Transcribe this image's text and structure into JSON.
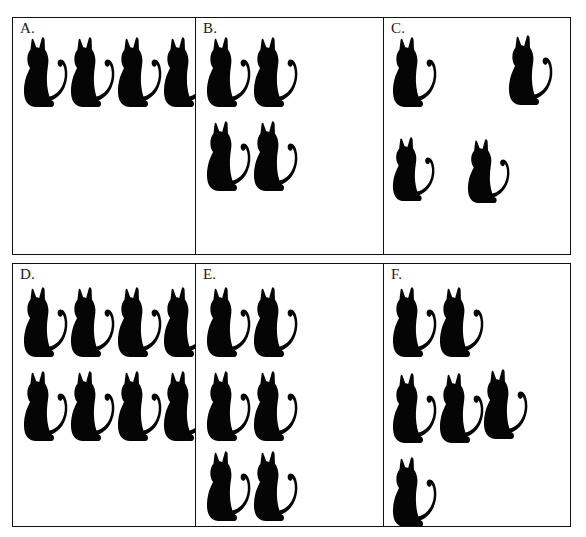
{
  "document": {
    "title": "Counting sets of cats worksheet",
    "background_color": "#ffffff",
    "ink_color": "#050505",
    "border_color": "#111111",
    "icon": "cat-silhouette-icon"
  },
  "panels": [
    {
      "id": "A",
      "label": "A.",
      "cat_count": 4,
      "arrangement": "one row of 4",
      "cats": [
        {
          "x": 10,
          "y": 18,
          "w": 46,
          "h": 72
        },
        {
          "x": 57,
          "y": 18,
          "w": 46,
          "h": 72
        },
        {
          "x": 104,
          "y": 18,
          "w": 46,
          "h": 72
        },
        {
          "x": 150,
          "y": 18,
          "w": 46,
          "h": 72
        }
      ]
    },
    {
      "id": "B",
      "label": "B.",
      "cat_count": 4,
      "arrangement": "two rows of 2",
      "cats": [
        {
          "x": 10,
          "y": 18,
          "w": 46,
          "h": 72
        },
        {
          "x": 57,
          "y": 18,
          "w": 46,
          "h": 72
        },
        {
          "x": 10,
          "y": 102,
          "w": 46,
          "h": 72
        },
        {
          "x": 57,
          "y": 102,
          "w": 46,
          "h": 72
        }
      ]
    },
    {
      "id": "C",
      "label": "C.",
      "cat_count": 4,
      "arrangement": "scattered",
      "cats": [
        {
          "x": 8,
          "y": 18,
          "w": 46,
          "h": 72
        },
        {
          "x": 124,
          "y": 16,
          "w": 46,
          "h": 72
        },
        {
          "x": 8,
          "y": 118,
          "w": 44,
          "h": 66
        },
        {
          "x": 83,
          "y": 120,
          "w": 44,
          "h": 66
        }
      ]
    },
    {
      "id": "D",
      "label": "D.",
      "cat_count": 8,
      "arrangement": "two rows of 4",
      "cats": [
        {
          "x": 10,
          "y": 22,
          "w": 46,
          "h": 72
        },
        {
          "x": 57,
          "y": 22,
          "w": 46,
          "h": 72
        },
        {
          "x": 104,
          "y": 22,
          "w": 46,
          "h": 72
        },
        {
          "x": 150,
          "y": 22,
          "w": 46,
          "h": 72
        },
        {
          "x": 10,
          "y": 106,
          "w": 46,
          "h": 72
        },
        {
          "x": 57,
          "y": 106,
          "w": 46,
          "h": 72
        },
        {
          "x": 104,
          "y": 106,
          "w": 46,
          "h": 72
        },
        {
          "x": 150,
          "y": 106,
          "w": 46,
          "h": 72
        }
      ]
    },
    {
      "id": "E",
      "label": "E.",
      "cat_count": 6,
      "arrangement": "three rows of 2",
      "cats": [
        {
          "x": 10,
          "y": 22,
          "w": 46,
          "h": 72
        },
        {
          "x": 57,
          "y": 22,
          "w": 46,
          "h": 72
        },
        {
          "x": 10,
          "y": 106,
          "w": 46,
          "h": 72
        },
        {
          "x": 57,
          "y": 106,
          "w": 46,
          "h": 72
        },
        {
          "x": 10,
          "y": 186,
          "w": 46,
          "h": 72
        },
        {
          "x": 57,
          "y": 186,
          "w": 46,
          "h": 72
        }
      ]
    },
    {
      "id": "F",
      "label": "F.",
      "cat_count": 6,
      "arrangement": "rows of 2, 3 and 1",
      "cats": [
        {
          "x": 8,
          "y": 22,
          "w": 46,
          "h": 72
        },
        {
          "x": 55,
          "y": 22,
          "w": 46,
          "h": 72
        },
        {
          "x": 8,
          "y": 108,
          "w": 46,
          "h": 72
        },
        {
          "x": 55,
          "y": 108,
          "w": 46,
          "h": 72
        },
        {
          "x": 99,
          "y": 104,
          "w": 46,
          "h": 72
        },
        {
          "x": 8,
          "y": 192,
          "w": 46,
          "h": 72
        }
      ]
    }
  ]
}
